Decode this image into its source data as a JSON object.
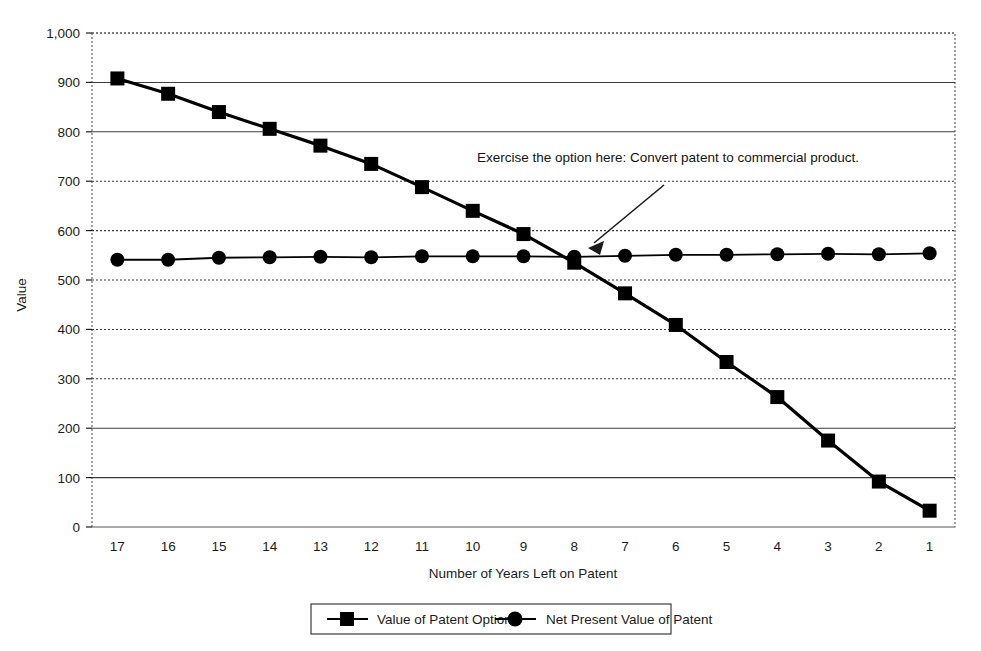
{
  "chart_data": {
    "type": "line",
    "title": "",
    "xlabel": "Number of Years Left on Patent",
    "ylabel": "Value",
    "categories": [
      "17",
      "16",
      "15",
      "14",
      "13",
      "12",
      "11",
      "10",
      "9",
      "8",
      "7",
      "6",
      "5",
      "4",
      "3",
      "2",
      "1"
    ],
    "x_reversed": true,
    "ylim": [
      0,
      1000
    ],
    "ytick_values": [
      0,
      100,
      200,
      300,
      400,
      500,
      600,
      700,
      800,
      900,
      1000
    ],
    "ytick_labels": [
      "0",
      "100",
      "200",
      "300",
      "400",
      "500",
      "600",
      "700",
      "800",
      "900",
      "1,000"
    ],
    "grid": true,
    "grid_axis": "y",
    "legend_position": "bottom-outside",
    "series": [
      {
        "name": "Value of Patent Option",
        "marker": "square",
        "color": "#000000",
        "values": [
          908,
          877,
          840,
          806,
          772,
          735,
          688,
          640,
          593,
          535,
          473,
          409,
          334,
          263,
          175,
          92,
          33
        ]
      },
      {
        "name": "Net Present Value of Patent",
        "marker": "circle",
        "color": "#000000",
        "values": [
          541,
          541,
          545,
          546,
          547,
          546,
          548,
          548,
          548,
          547,
          549,
          551,
          551,
          552,
          553,
          552,
          554
        ]
      }
    ],
    "annotations": [
      {
        "text": "Exercise the option here: Convert patent to commercial product.",
        "points_to_category": "8",
        "points_to_value": 545
      }
    ]
  },
  "axis": {
    "y_title": "Value",
    "x_title": "Number of Years Left on Patent"
  },
  "legend": {
    "entries": [
      {
        "label": "Value of Patent Option",
        "marker": "square"
      },
      {
        "label": "Net Present Value of Patent",
        "marker": "circle"
      }
    ]
  },
  "annotation": {
    "text": "Exercise the option here: Convert patent to commercial product."
  },
  "colors": {
    "ink": "#000000",
    "grid": "#4a4a4a",
    "background": "#ffffff"
  }
}
